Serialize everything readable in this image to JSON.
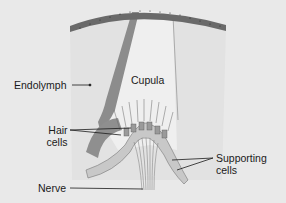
{
  "diagram": {
    "colors": {
      "background": "#e9e9e9",
      "endolymph": "#e2e2e2",
      "cupula": "#eeeeee",
      "membrane": "#6e6e6e",
      "canal_wall": "#8a8a8a",
      "cells": "#c4c4c4",
      "label_text": "#1a1a1a"
    },
    "labels": {
      "endolymph": "Endolymph",
      "cupula": "Cupula",
      "hair_cells_line1": "Hair",
      "hair_cells_line2": "cells",
      "supporting_cells_line1": "Supporting",
      "supporting_cells_line2": "cells",
      "nerve": "Nerve"
    }
  }
}
